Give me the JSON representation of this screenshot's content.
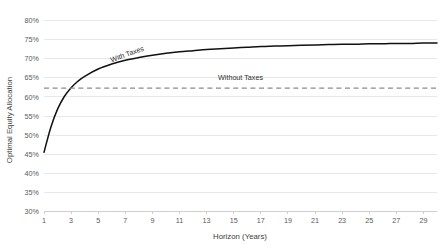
{
  "chart_data": {
    "type": "line",
    "title": "",
    "xlabel": "Horizon (Years)",
    "ylabel": "Optimal Equity Allocation",
    "xlim": [
      1,
      30
    ],
    "ylim": [
      30,
      80
    ],
    "grid": true,
    "legend_position": "inline-annotations",
    "x_ticks": [
      "1",
      "3",
      "5",
      "7",
      "9",
      "11",
      "13",
      "15",
      "17",
      "19",
      "21",
      "23",
      "25",
      "27",
      "29"
    ],
    "x_tick_values": [
      1,
      3,
      5,
      7,
      9,
      11,
      13,
      15,
      17,
      19,
      21,
      23,
      25,
      27,
      29
    ],
    "y_ticks": [
      "30%",
      "35%",
      "40%",
      "45%",
      "50%",
      "55%",
      "60%",
      "65%",
      "70%",
      "75%",
      "80%"
    ],
    "y_tick_values": [
      30,
      35,
      40,
      45,
      50,
      55,
      60,
      65,
      70,
      75,
      80
    ],
    "annotations": [
      {
        "label": "With Taxes",
        "x": 7.2,
        "y": 70.6,
        "rotation": -20
      },
      {
        "label": "Without Taxes",
        "x": 15.5,
        "y": 64.4,
        "rotation": 0
      }
    ],
    "series": [
      {
        "name": "With Taxes",
        "style": "solid",
        "color": "#111111",
        "x": [
          1,
          1.5,
          2,
          2.5,
          3,
          3.5,
          4,
          5,
          6,
          7,
          8,
          9,
          10,
          11,
          12,
          13,
          14,
          15,
          16,
          17,
          18,
          19,
          20,
          21,
          22,
          23,
          24,
          25,
          26,
          27,
          28,
          29,
          30
        ],
        "values": [
          45.5,
          52.0,
          56.8,
          60.1,
          62.4,
          64.1,
          65.4,
          67.3,
          68.6,
          69.6,
          70.3,
          70.9,
          71.4,
          71.8,
          72.1,
          72.4,
          72.6,
          72.8,
          73.0,
          73.2,
          73.3,
          73.4,
          73.5,
          73.6,
          73.7,
          73.8,
          73.8,
          73.9,
          73.9,
          74.0,
          74.0,
          74.1,
          74.1
        ]
      },
      {
        "name": "Without Taxes",
        "style": "dashed",
        "color": "#8c8c8c",
        "x": [
          1,
          30
        ],
        "values": [
          62.3,
          62.3
        ]
      }
    ]
  }
}
